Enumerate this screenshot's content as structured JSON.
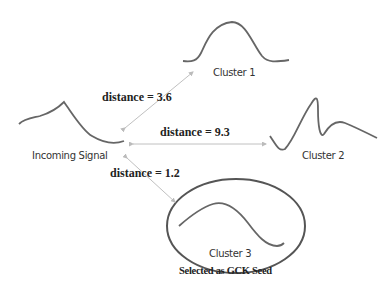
{
  "diagram": {
    "nodes": {
      "incoming": {
        "label": "Incoming Signal"
      },
      "cluster1": {
        "label": "Cluster 1"
      },
      "cluster2": {
        "label": "Cluster 2"
      },
      "cluster3": {
        "label": "Cluster 3",
        "note": "Selected as GCK Seed"
      }
    },
    "edges": [
      {
        "from": "Incoming Signal",
        "to": "Cluster 1",
        "label": "distance = 3.6"
      },
      {
        "from": "Incoming Signal",
        "to": "Cluster 2",
        "label": "distance = 9.3"
      },
      {
        "from": "Incoming Signal",
        "to": "Cluster 3",
        "label": "distance = 1.2"
      }
    ],
    "colors": {
      "curve": "#666666",
      "arrow": "#bbbbbb",
      "text": "#222222"
    }
  }
}
